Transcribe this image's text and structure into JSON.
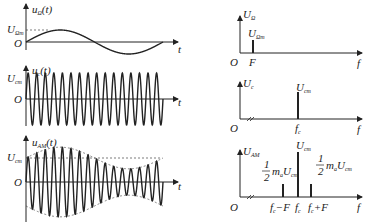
{
  "time_domain": {
    "modulating": {
      "ylabel": "u",
      "ylabel_sub": "Ω",
      "ylabel_arg": "(t)",
      "amp_label": "U",
      "amp_sub": "Ωm",
      "origin": "O",
      "xlabel": "t",
      "cycles": 1
    },
    "carrier": {
      "ylabel": "u",
      "ylabel_sub": "c",
      "ylabel_arg": "(t)",
      "amp_label": "U",
      "amp_sub": "cm",
      "origin": "O",
      "xlabel": "t",
      "cycles": 16
    },
    "am": {
      "ylabel": "u",
      "ylabel_sub": "AM",
      "ylabel_arg": "(t)",
      "amp_label": "U",
      "amp_sub": "cm",
      "origin": "O",
      "xlabel": "t",
      "cycles": 16,
      "mod_index": 0.45
    }
  },
  "spectrum": {
    "modulating": {
      "ylabel": "U",
      "ylabel_sub": "Ω",
      "line_label": "U",
      "line_sub": "Ωm",
      "origin": "O",
      "xlabel": "f",
      "freq_label": "F"
    },
    "carrier": {
      "ylabel": "U",
      "ylabel_sub": "c",
      "line_label": "U",
      "line_sub": "cm",
      "origin": "O",
      "xlabel": "f",
      "freq_label": "f",
      "freq_sub": "c"
    },
    "am": {
      "ylabel": "U",
      "ylabel_sub": "AM",
      "origin": "O",
      "xlabel": "f",
      "center_label": "U",
      "center_sub": "cm",
      "side_frac_num": "1",
      "side_frac_den": "2",
      "side_text": "m",
      "side_sub": "a",
      "side_U": "U",
      "side_U_sub": "cm",
      "freqs": [
        {
          "label": "f",
          "sub": "c",
          "suffix": "−F"
        },
        {
          "label": "f",
          "sub": "c",
          "suffix": ""
        },
        {
          "label": "f",
          "sub": "c",
          "suffix": "+F"
        }
      ]
    }
  }
}
